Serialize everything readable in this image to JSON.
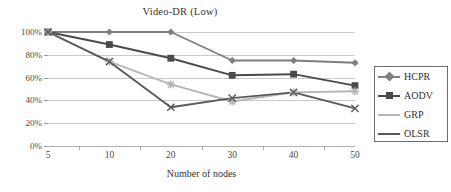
{
  "chart_data": {
    "type": "line",
    "title": "Video-DR (Low)",
    "xlabel": "Number of nodes",
    "ylabel": "",
    "categories": [
      "5",
      "10",
      "20",
      "30",
      "40",
      "50"
    ],
    "ylim": [
      0,
      100
    ],
    "yticks": [
      "0%",
      "20%",
      "40%",
      "60%",
      "80%",
      "100%"
    ],
    "ytick_values": [
      0,
      20,
      40,
      60,
      80,
      100
    ],
    "grid": true,
    "legend_position": "right",
    "series": [
      {
        "name": "HCPR",
        "marker": "diamond",
        "color": "#7f7f7f",
        "values": [
          100,
          100,
          100,
          75,
          75,
          73
        ]
      },
      {
        "name": "AODV",
        "marker": "square",
        "color": "#4a4a4a",
        "values": [
          100,
          89,
          77,
          62,
          63,
          53
        ]
      },
      {
        "name": "GRP",
        "marker": "star",
        "color": "#b5b5b5",
        "values": [
          100,
          74,
          54,
          39,
          47,
          48
        ]
      },
      {
        "name": "OLSR",
        "marker": "cross",
        "color": "#595959",
        "values": [
          100,
          74,
          34,
          42,
          47,
          33
        ]
      }
    ]
  },
  "colors": {
    "gridline": "#c9c9c9",
    "axis": "#a8a8a8",
    "text": "#3a3a3a",
    "legend_border": "#6b6b6b",
    "background": "#ffffff"
  }
}
